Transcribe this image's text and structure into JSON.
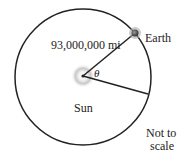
{
  "diagram": {
    "labels": {
      "distance": "93,000,000 mi",
      "earth": "Earth",
      "sun": "Sun",
      "angle": "θ",
      "note_line1": "Not to",
      "note_line2": "scale"
    },
    "colors": {
      "orbit": "#222222",
      "sun_glow": "#bbbbbb",
      "earth": "#555555"
    }
  }
}
